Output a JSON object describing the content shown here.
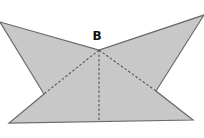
{
  "diagram": {
    "type": "geometry-figure",
    "fill_color": "#c8c8c8",
    "stroke_color": "#6a6a6a",
    "dash_color": "#555555",
    "point_labels": [
      {
        "id": "B",
        "text": "B",
        "x": 97,
        "y": 40
      }
    ],
    "outline_points": "0,22 99,50 204,15 156,91 193,120 9,123 44,94",
    "dashed_segments": [
      {
        "from": "B",
        "to": "left-notch",
        "x1": 99,
        "y1": 50,
        "x2": 44,
        "y2": 94
      },
      {
        "from": "B",
        "to": "right-notch",
        "x1": 99,
        "y1": 50,
        "x2": 156,
        "y2": 91
      },
      {
        "from": "B",
        "to": "base-midpoint",
        "x1": 99,
        "y1": 50,
        "x2": 99,
        "y2": 122
      }
    ]
  }
}
